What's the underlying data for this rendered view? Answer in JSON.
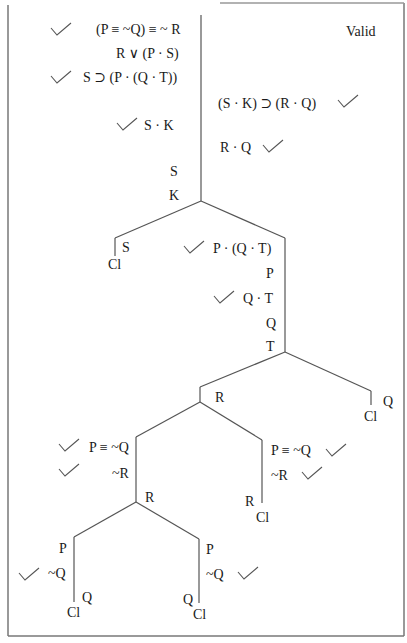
{
  "verdict": "Valid",
  "premises": [
    {
      "text": "(P ≡ ~Q) ≡ ~ R",
      "checked": true
    },
    {
      "text": "R ∨ (P · S)",
      "checked": false
    },
    {
      "text": "S ⊃ (P · (Q · T))",
      "checked": true
    }
  ],
  "negated_conclusion": {
    "text": "(S · K) ⊃ (R · Q)",
    "checked": true
  },
  "trunk_left": [
    {
      "text": "S · K",
      "checked": true
    },
    {
      "text": "S",
      "checked": false
    },
    {
      "text": "K",
      "checked": false
    }
  ],
  "trunk_right": [
    {
      "text": "R · Q",
      "checked": true
    }
  ],
  "branch1": {
    "left": {
      "text": "S",
      "closed": "Cl"
    },
    "right": [
      {
        "text": "P · (Q · T)",
        "checked": true
      },
      {
        "text": "P",
        "checked": false
      },
      {
        "text": "Q · T",
        "checked": true
      },
      {
        "text": "Q",
        "checked": false
      },
      {
        "text": "T",
        "checked": false
      }
    ]
  },
  "branch2": {
    "left_label": "R",
    "right": {
      "text": "Q",
      "closed": "Cl"
    }
  },
  "branch3": {
    "left": [
      {
        "text": "P ≡ ~Q",
        "checked": true
      },
      {
        "text": "~R",
        "checked": true
      }
    ],
    "left_label": "R",
    "right": [
      {
        "text": "P ≡ ~Q",
        "checked": true
      },
      {
        "text": "~R",
        "checked": true
      }
    ],
    "right_close_label": "R",
    "right_closed": "Cl"
  },
  "branch4": {
    "left": [
      {
        "text": "P",
        "checked": false
      },
      {
        "text": "~Q",
        "checked": true
      }
    ],
    "left_close_label": "Q",
    "left_closed": "Cl",
    "right": [
      {
        "text": "P",
        "checked": false
      },
      {
        "text": "~Q",
        "checked": true
      }
    ],
    "right_close_label": "Q",
    "right_closed": "Cl"
  },
  "colors": {
    "line": "#555555",
    "text": "#1a1a1a",
    "border": "#666666"
  }
}
